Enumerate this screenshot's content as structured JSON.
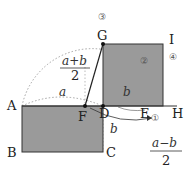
{
  "points": {
    "A": "A",
    "B": "B",
    "C": "C",
    "D": "D",
    "E": "E",
    "F": "F",
    "G": "G",
    "H": "H",
    "I": "I"
  },
  "markers": {
    "m1": "①",
    "m2": "②",
    "m3": "③",
    "m4": "④"
  },
  "expressions": {
    "a_plus_b_num": "a+b",
    "a_plus_b_den": "2",
    "a": "a",
    "b_top": "b",
    "b_side": "b",
    "a_minus_b_num": "a−b",
    "a_minus_b_den": "2"
  },
  "colors": {
    "fill": "#9a9a9a",
    "stroke": "#333333",
    "dotted": "#999999"
  }
}
